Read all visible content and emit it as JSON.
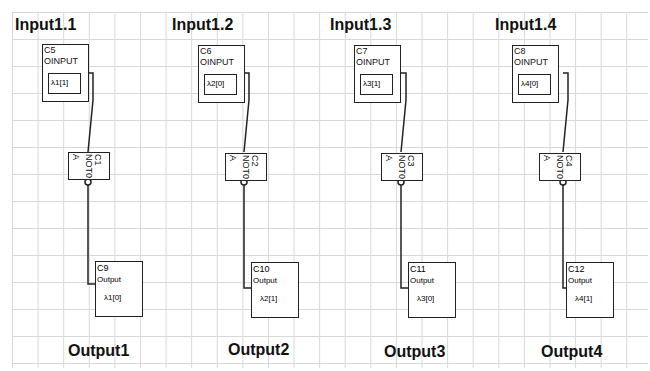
{
  "columns": [
    {
      "input_title": "Input1.1",
      "input_component": {
        "id": "C5",
        "kind": "OINPUT",
        "value": "λ1[1]"
      },
      "not_gate": {
        "id": "C1",
        "label": "NOT0",
        "pin": "A"
      },
      "output_component": {
        "id": "C9",
        "kind": "Output",
        "value": "λ1[0]"
      },
      "output_title": "Output1"
    },
    {
      "input_title": "Input1.2",
      "input_component": {
        "id": "C6",
        "kind": "OINPUT",
        "value": "λ2[0]"
      },
      "not_gate": {
        "id": "C2",
        "label": "NOT0",
        "pin": "A"
      },
      "output_component": {
        "id": "C10",
        "kind": "Output",
        "value": "λ2[1]"
      },
      "output_title": "Output2"
    },
    {
      "input_title": "Input1.3",
      "input_component": {
        "id": "C7",
        "kind": "OINPUT",
        "value": "λ3[1]"
      },
      "not_gate": {
        "id": "C3",
        "label": "NOT0",
        "pin": "A"
      },
      "output_component": {
        "id": "C11",
        "kind": "Output",
        "value": "λ3[0]"
      },
      "output_title": "Output3"
    },
    {
      "input_title": "Input1.4",
      "input_component": {
        "id": "C8",
        "kind": "OINPUT",
        "value": "λ4[0]"
      },
      "not_gate": {
        "id": "C4",
        "label": "NOT0",
        "pin": "A"
      },
      "output_component": {
        "id": "C12",
        "kind": "Output",
        "value": "λ4[1]"
      },
      "output_title": "Output4"
    }
  ],
  "colors": {
    "grid": "#d8d8d8",
    "stroke": "#222222",
    "background": "#ffffff"
  }
}
